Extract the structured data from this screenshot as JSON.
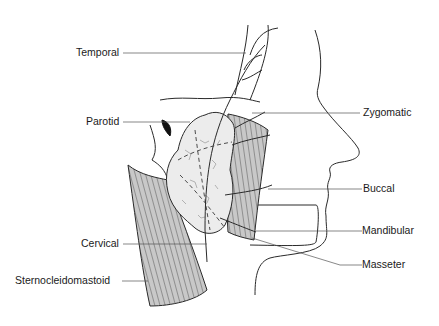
{
  "diagram": {
    "type": "anatomical-illustration",
    "colors": {
      "background": "#ffffff",
      "outline": "#2a2a2a",
      "muscle_fill": "#c8c8c8",
      "gland_fill": "#ececec",
      "leader_line": "#555555",
      "text": "#1a1a1a"
    },
    "labels": {
      "temporal": "Temporal",
      "parotid": "Parotid",
      "zygomatic": "Zygomatic",
      "buccal": "Buccal",
      "mandibular": "Mandibular",
      "cervical": "Cervical",
      "masseter": "Masseter",
      "sternocleidomastoid": "Sternocleidomastoid"
    }
  }
}
